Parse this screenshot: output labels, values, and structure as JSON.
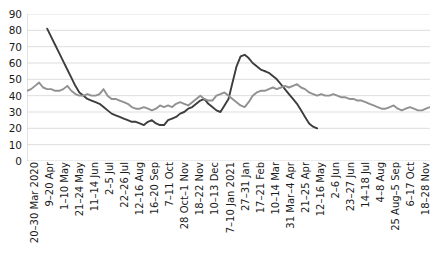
{
  "chart_data": {
    "type": "line",
    "title": "",
    "subtitle": "",
    "xlabel": "",
    "ylabel": "",
    "ylim": [
      0,
      90
    ],
    "y_ticks": [
      0,
      10,
      20,
      30,
      40,
      50,
      60,
      70,
      80,
      90
    ],
    "grid": true,
    "grid_color": "#d9d9d9",
    "legend": "none",
    "legend_position": "none",
    "categories": [
      "20–30 Mar 2020",
      "9–20 Apr",
      "1–10 May",
      "21–24 May",
      "11–14 Jun",
      "2–5 Jul",
      "22–26 Jul",
      "12–16 Aug",
      "16–20 Sep",
      "7–11 Oct",
      "28 Oct–1 Nov",
      "18–22 Nov",
      "10–13 Dec",
      "7–10 Jan 2021",
      "27–31 Jan",
      "17–21 Feb",
      "10–14 Mar",
      "31 Mar–4 Apr",
      "21–25 Apr",
      "12–16 May",
      "2–6 Jun",
      "23–27 Jun",
      "14–18 Jul",
      "4–8 Aug",
      "25 Aug–5 Sep",
      "6–17 Oct",
      "18–28 Nov"
    ],
    "series": [
      {
        "name": "dark-series",
        "color": "#3d3d3d",
        "start_index": 5,
        "end_index": 59,
        "x": [
          5,
          6,
          7,
          8,
          9,
          10,
          11,
          12,
          13,
          14,
          15,
          16,
          17,
          18,
          19,
          20,
          21,
          22,
          23,
          24,
          25,
          26,
          27,
          28,
          29,
          30,
          31,
          32,
          33,
          34,
          35,
          36,
          37,
          38,
          39,
          40,
          41,
          42,
          43,
          44,
          45,
          46,
          47,
          48,
          49,
          50,
          51,
          52,
          53,
          54,
          55,
          56,
          57,
          58,
          59
        ],
        "values": [
          81,
          76,
          71,
          66,
          61,
          56,
          51,
          46,
          42,
          40,
          38,
          37,
          36,
          35,
          33,
          31,
          29,
          28,
          27,
          26,
          25,
          24,
          24,
          23,
          22,
          24,
          25,
          23,
          22,
          22,
          25,
          26,
          27,
          29,
          30,
          32,
          33,
          35,
          37,
          38,
          35,
          33,
          31,
          30,
          34,
          38,
          48,
          58,
          64,
          65,
          63,
          60,
          58,
          56,
          55
        ]
      },
      {
        "name": "dark-series-tail",
        "color": "#3d3d3d",
        "x": [
          59,
          60,
          61,
          62,
          63,
          64,
          65,
          66,
          67,
          68,
          69,
          70,
          71,
          72
        ],
        "values": [
          55,
          54,
          52,
          50,
          47,
          44,
          41,
          38,
          35,
          31,
          27,
          23,
          21,
          20
        ]
      },
      {
        "name": "gray-series",
        "color": "#919191",
        "start_index": 0,
        "end_index": 100,
        "x": [
          0,
          1,
          2,
          3,
          4,
          5,
          6,
          7,
          8,
          9,
          10,
          11,
          12,
          13,
          14,
          15,
          16,
          17,
          18,
          19,
          20,
          21,
          22,
          23,
          24,
          25,
          26,
          27,
          28,
          29,
          30,
          31,
          32,
          33,
          34,
          35,
          36,
          37,
          38,
          39,
          40,
          41,
          42,
          43,
          44,
          45,
          46,
          47,
          48,
          49,
          50,
          51,
          52,
          53,
          54,
          55,
          56,
          57,
          58,
          59,
          60,
          61,
          62,
          63,
          64,
          65,
          66,
          67,
          68,
          69,
          70,
          71,
          72,
          73,
          74,
          75,
          76,
          77,
          78,
          79,
          80,
          81,
          82,
          83,
          84,
          85,
          86,
          87,
          88,
          89,
          90,
          91,
          92,
          93,
          94,
          95,
          96,
          97,
          98,
          99,
          100
        ],
        "values": [
          43,
          44,
          46,
          48,
          45,
          44,
          44,
          43,
          43,
          44,
          46,
          43,
          41,
          40,
          40,
          41,
          40,
          40,
          41,
          44,
          40,
          38,
          38,
          37,
          36,
          35,
          33,
          32,
          32,
          33,
          32,
          31,
          32,
          34,
          33,
          34,
          33,
          35,
          36,
          35,
          34,
          36,
          38,
          40,
          38,
          37,
          37,
          40,
          41,
          42,
          40,
          38,
          36,
          34,
          33,
          36,
          40,
          42,
          43,
          43,
          44,
          45,
          44,
          45,
          46,
          45,
          46,
          47,
          45,
          44,
          42,
          41,
          40,
          41,
          40,
          40,
          41,
          40,
          39,
          39,
          38,
          38,
          37,
          37,
          36,
          35,
          34,
          33,
          32,
          32,
          33,
          34,
          32,
          31,
          32,
          33,
          32,
          31,
          31,
          32,
          33
        ]
      }
    ]
  }
}
